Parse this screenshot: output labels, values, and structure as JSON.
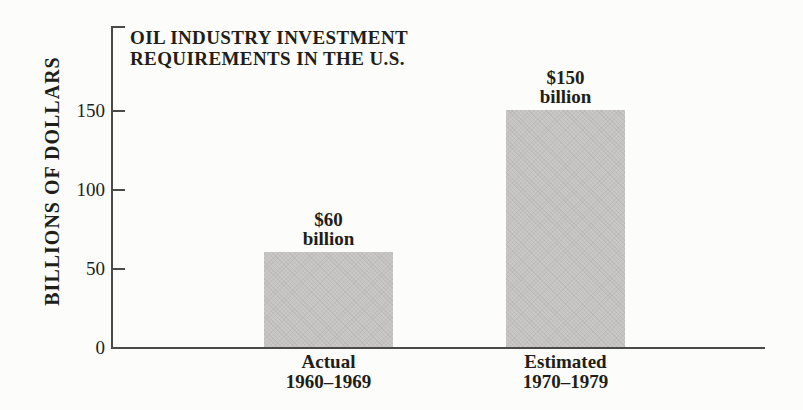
{
  "chart_data": {
    "type": "bar",
    "title_lines": [
      "OIL INDUSTRY INVESTMENT",
      "REQUIREMENTS IN THE U.S."
    ],
    "title": "OIL INDUSTRY INVESTMENT REQUIREMENTS IN THE U.S.",
    "xlabel": "",
    "ylabel": "BILLIONS OF DOLLARS",
    "yticks": [
      0,
      50,
      100,
      150
    ],
    "ylim": [
      0,
      202
    ],
    "grid": false,
    "legend": false,
    "categories": [
      "Actual 1960–1969",
      "Estimated 1970–1979"
    ],
    "values": [
      60,
      150
    ],
    "bars": [
      {
        "value": 60,
        "value_label_lines": [
          "$60",
          "billion"
        ],
        "category_lines": [
          "Actual",
          "1960–1969"
        ]
      },
      {
        "value": 150,
        "value_label_lines": [
          "$150",
          "billion"
        ],
        "category_lines": [
          "Estimated",
          "1970–1979"
        ]
      }
    ],
    "colors": {
      "background": "#fcfcfa",
      "bar_fill": "#c9c8c6",
      "axis_line": "#4a4a4a",
      "text": "#211e19"
    }
  }
}
